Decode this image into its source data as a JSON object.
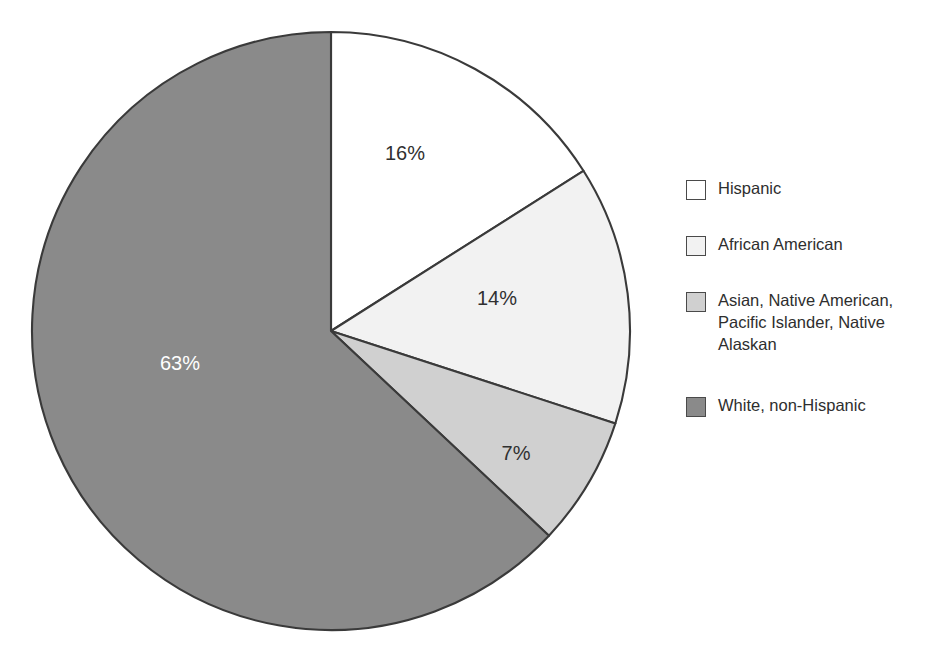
{
  "title": "",
  "chart_data": {
    "type": "pie",
    "title": "",
    "subtitle": "",
    "xlabel": "",
    "ylabel": "",
    "grid": false,
    "legend_position": "right",
    "start_angle_deg": 0,
    "direction": "clockwise",
    "center": {
      "x": 331,
      "y": 331
    },
    "radius": 299,
    "categories": [
      "Hispanic",
      "African American",
      "Asian, Native American, Pacific Islander, Native Alaskan",
      "White, non-Hispanic"
    ],
    "values": [
      16,
      14,
      7,
      63
    ],
    "value_labels": [
      "16%",
      "14%",
      "7%",
      "63%"
    ],
    "colors": [
      "#ffffff",
      "#f2f2f2",
      "#d0d0d0",
      "#8a8a8a"
    ],
    "slices": [
      {
        "name": "Hispanic",
        "value": 16,
        "label": "16%",
        "color": "#ffffff",
        "label_x": 405,
        "label_y": 160,
        "label_on_dark": false
      },
      {
        "name": "African American",
        "value": 14,
        "label": "14%",
        "color": "#f2f2f2",
        "label_x": 497,
        "label_y": 305,
        "label_on_dark": false
      },
      {
        "name": "Asian, Native American, Pacific Islander, Native Alaskan",
        "value": 7,
        "label": "7%",
        "color": "#d0d0d0",
        "label_x": 516,
        "label_y": 460,
        "label_on_dark": false
      },
      {
        "name": "White, non-Hispanic",
        "value": 63,
        "label": "63%",
        "color": "#8a8a8a",
        "label_x": 180,
        "label_y": 370,
        "label_on_dark": true
      }
    ]
  },
  "legend": {
    "items": [
      {
        "label": "Hispanic",
        "color": "#ffffff"
      },
      {
        "label": "African American",
        "color": "#f2f2f2"
      },
      {
        "label": "Asian, Native American,\nPacific Islander, Native\nAlaskan",
        "color": "#d0d0d0"
      },
      {
        "label": "White, non-Hispanic",
        "color": "#8a8a8a"
      }
    ]
  }
}
